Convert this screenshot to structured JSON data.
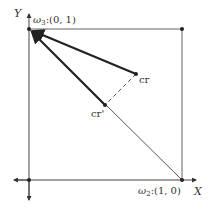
{
  "axes": {
    "x_label": "X",
    "y_label": "Y"
  },
  "vertices": {
    "omega3": {
      "label_sym": "ω",
      "label_sub": "3",
      "label_coords": ":(0, 1)"
    },
    "omega2": {
      "label_sym": "ω",
      "label_sub": "2",
      "label_coords": ":(1, 0)"
    }
  },
  "points": {
    "cr": {
      "label": "cr"
    },
    "cr_prime": {
      "label": "cr'"
    }
  },
  "colors": {
    "line": "#333333",
    "frame": "#555555",
    "arrow": "#222222"
  }
}
